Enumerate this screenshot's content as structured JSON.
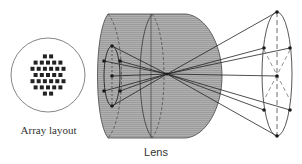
{
  "labels": {
    "array_layout": "Array layout",
    "lens": "Lens"
  },
  "colors": {
    "lens_fill": "#a8a8a8",
    "line": "#333333",
    "dot": "#222222",
    "background": "#ffffff"
  },
  "array": {
    "rows": [
      2,
      5,
      6,
      5,
      6,
      5,
      2
    ]
  },
  "focal_point": [
    167,
    74
  ]
}
